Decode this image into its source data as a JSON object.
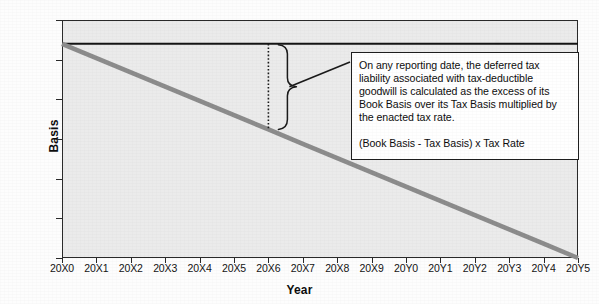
{
  "chart_data": {
    "type": "line",
    "title": "",
    "xlabel": "Year",
    "ylabel": "Basis",
    "grid": false,
    "legend_position": "none",
    "categories": [
      "20X0",
      "20X1",
      "20X2",
      "20X3",
      "20X4",
      "20X5",
      "20X6",
      "20X7",
      "20X8",
      "20X9",
      "20Y0",
      "20Y1",
      "20Y2",
      "20Y3",
      "20Y4",
      "20Y5"
    ],
    "ylim": [
      0,
      600
    ],
    "y_ticks": [
      0,
      100,
      200,
      300,
      400,
      500,
      600
    ],
    "series": [
      {
        "name": "Book Basis",
        "style": "solid-thin-black",
        "color": "#141414",
        "values": [
          540,
          540,
          540,
          540,
          540,
          540,
          540,
          540,
          540,
          540,
          540,
          540,
          540,
          540,
          540,
          540
        ]
      },
      {
        "name": "Tax Basis",
        "style": "solid-thick-gray",
        "color": "#8c8c8c",
        "values": [
          540,
          504,
          468,
          432,
          396,
          360,
          324,
          288,
          252,
          216,
          180,
          144,
          108,
          72,
          36,
          0
        ]
      }
    ],
    "annotations": {
      "gap_marker": {
        "at_category": "20X6",
        "from_value": 540,
        "to_value": 324,
        "style": "dotted-vertical-with-brace"
      }
    }
  },
  "callout": {
    "paragraph": "On any reporting date, the deferred tax liability associated with tax-deductible goodwill is calculated as the excess of its Book Basis over its Tax Basis multiplied by the enacted tax rate.",
    "formula": "(Book Basis - Tax Basis) x Tax Rate"
  },
  "colors": {
    "plot_background": "#ebebeb",
    "frame": "#2a2a2a",
    "book_basis_line": "#141414",
    "tax_basis_line": "#8c8c8c",
    "callout_background": "#ffffff",
    "callout_border": "#1f1f1f",
    "text": "#0d0d0d"
  }
}
